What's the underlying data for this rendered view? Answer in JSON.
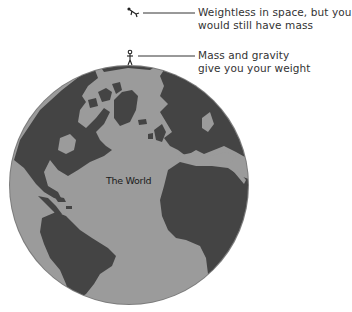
{
  "diagram": {
    "globe": {
      "label": "The World",
      "ocean_color": "#9a9a9a",
      "land_color": "#444444",
      "edge_color": "#7a7a7a"
    },
    "annotations": [
      {
        "id": "space",
        "figure": "floating-astronaut",
        "line1": "Weightless in space, but you",
        "line2": "would still have mass"
      },
      {
        "id": "earth",
        "figure": "standing-person",
        "line1": "Mass and gravity",
        "line2": "give you your weight"
      }
    ],
    "leader_line_color": "#333333"
  }
}
